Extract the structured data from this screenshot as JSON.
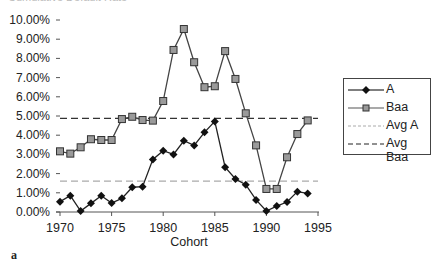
{
  "chart_data": {
    "type": "line",
    "title": "Cumulative Default Rate",
    "xlabel": "Cohort",
    "ylabel": "",
    "panel_label": "a",
    "xlim": [
      1970,
      1995
    ],
    "ylim": [
      0,
      10
    ],
    "x_ticks": [
      "1970",
      "1975",
      "1980",
      "1985",
      "1990",
      "1995"
    ],
    "y_ticks": [
      "0.00%",
      "1.00%",
      "2.00%",
      "3.00%",
      "4.00%",
      "5.00%",
      "6.00%",
      "7.00%",
      "8.00%",
      "9.00%",
      "10.00%"
    ],
    "grid": false,
    "legend_position": "right",
    "x": [
      1970,
      1971,
      1972,
      1973,
      1974,
      1975,
      1976,
      1977,
      1978,
      1979,
      1980,
      1981,
      1982,
      1983,
      1984,
      1985,
      1986,
      1987,
      1988,
      1989,
      1990,
      1991,
      1992,
      1993,
      1994
    ],
    "series": [
      {
        "name": "A",
        "style": "solid line, black diamond markers",
        "values": [
          0.54,
          0.85,
          0.05,
          0.45,
          0.85,
          0.47,
          0.71,
          1.29,
          1.32,
          2.74,
          3.19,
          3.0,
          3.71,
          3.47,
          4.15,
          4.72,
          2.33,
          1.72,
          1.42,
          0.63,
          0.05,
          0.31,
          0.52,
          1.06,
          0.97
        ]
      },
      {
        "name": "Baa",
        "style": "solid line, gray square markers",
        "values": [
          3.16,
          3.04,
          3.37,
          3.79,
          3.75,
          3.75,
          4.84,
          4.96,
          4.79,
          4.76,
          5.78,
          8.44,
          9.53,
          7.8,
          6.5,
          6.55,
          8.38,
          6.93,
          5.14,
          3.47,
          1.2,
          1.2,
          2.85,
          4.06,
          4.77
        ]
      },
      {
        "name": "Avg A",
        "style": "gray dashed horizontal line",
        "values_constant": 1.61
      },
      {
        "name": "Avg Baa",
        "style": "black dashed horizontal line",
        "values_constant": 4.88
      }
    ]
  },
  "legend": {
    "items": [
      "A",
      "Baa",
      "Avg A",
      "Avg Baa"
    ]
  },
  "labels": {
    "xlabel": "Cohort",
    "panel": "a",
    "title": "Cumulative Default Rate"
  }
}
